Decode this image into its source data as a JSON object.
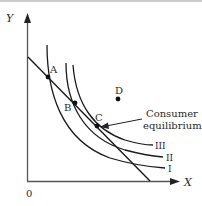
{
  "diagram": {
    "type": "indifference-curve-budget-line",
    "axes": {
      "y_label": "Y",
      "x_label": "X",
      "origin_label": "0"
    },
    "curves": [
      {
        "label": "I"
      },
      {
        "label": "II"
      },
      {
        "label": "III"
      }
    ],
    "points": [
      {
        "label": "A"
      },
      {
        "label": "B"
      },
      {
        "label": "C"
      },
      {
        "label": "D"
      }
    ],
    "annotation": {
      "line1": "Consumer",
      "line2": "equilibrium"
    },
    "colors": {
      "line": "#1a1a1a",
      "axis": "#555555",
      "text": "#2a2a2a"
    }
  }
}
